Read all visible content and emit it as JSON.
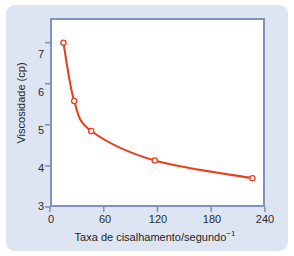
{
  "chart_data": {
    "type": "line",
    "title": "",
    "xlabel": "Taxa de cisalhamento/segundo",
    "xlabel_exponent": "−1",
    "ylabel": "Viscosidade (cp)",
    "xlim": [
      0,
      240
    ],
    "ylim": [
      3,
      7.6
    ],
    "xticks": [
      0,
      60,
      120,
      180,
      240
    ],
    "yticks": [
      3,
      4,
      5,
      6,
      7
    ],
    "xtick_labels": [
      "0",
      "60",
      "120",
      "180",
      "240"
    ],
    "ytick_labels": [
      "3",
      "4",
      "5",
      "6",
      "7"
    ],
    "grid": false,
    "legend": false,
    "series": [
      {
        "name": "Viscosidade",
        "marker": "open-circle",
        "line_color": "#e8401c",
        "marker_face_color": "#ffffff",
        "marker_edge_color": "#e8401c",
        "x": [
          15,
          27,
          46,
          117,
          226
        ],
        "y": [
          7.0,
          5.58,
          4.85,
          4.13,
          3.7
        ]
      }
    ],
    "annotations": []
  },
  "style": {
    "panel_background": "#dde5f2",
    "figure_background": "#ffffff",
    "axis_frame_color": "#7f93bd",
    "tick_color": "#7f93bd",
    "text_color": "#1d1d1d",
    "accent": "#e8401c"
  }
}
